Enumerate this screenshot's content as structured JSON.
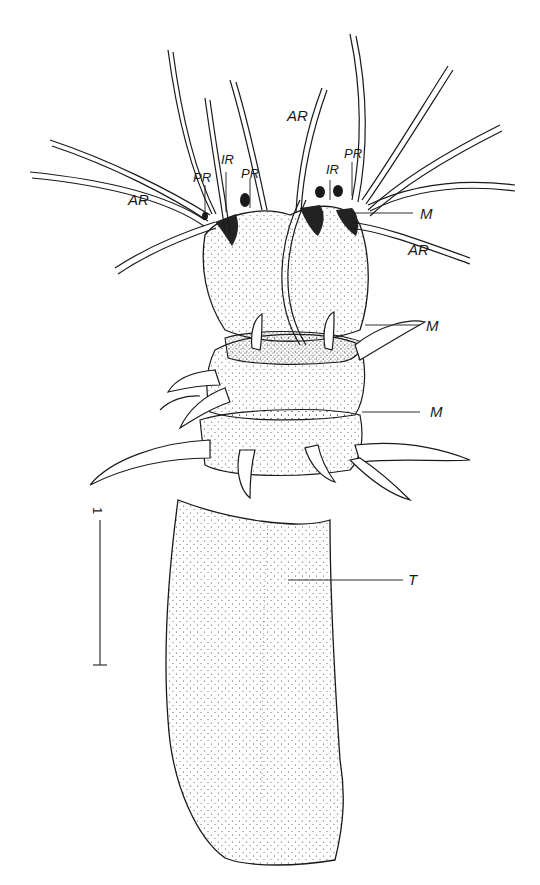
{
  "figure": {
    "colors": {
      "background": "#ffffff",
      "ink": "#1a1a1a",
      "stipple": "#444444"
    }
  },
  "labels": {
    "ar_left": "AR",
    "pr_left": "PR",
    "ir_left": "IR",
    "pr_mid": "PR",
    "ar_top": "AR",
    "ir_right": "IR",
    "pr_right": "PR",
    "m_top": "M",
    "ar_right": "AR",
    "m_mid": "M",
    "m_lower": "M",
    "t": "T"
  },
  "scale_bar": {
    "label": "1"
  }
}
